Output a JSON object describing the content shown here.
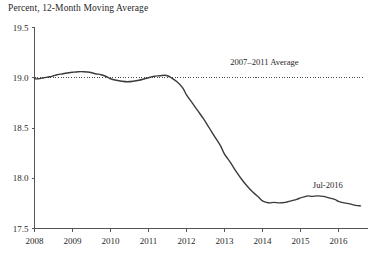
{
  "chart_data": {
    "type": "line",
    "title": "Percent, 12-Month Moving Average",
    "xlabel": "",
    "ylabel": "",
    "ylim": [
      17.5,
      19.5
    ],
    "xlim": [
      2008.0,
      2016.9
    ],
    "yticks": [
      "19.5",
      "19.0",
      "18.5",
      "18.0",
      "17.5"
    ],
    "ytick_values": [
      19.5,
      19.0,
      18.5,
      18.0,
      17.5
    ],
    "xticks": [
      "2008",
      "2009",
      "2010",
      "2011",
      "2012",
      "2013",
      "2014",
      "2015",
      "2016"
    ],
    "xtick_values": [
      2008,
      2009,
      2010,
      2011,
      2012,
      2013,
      2014,
      2015,
      2016
    ],
    "grid": false,
    "legend_position": "none",
    "series": [
      {
        "name": "Percent, 12-Month Moving Average",
        "x": [
          2008.0,
          2008.1,
          2008.25,
          2008.4,
          2008.5,
          2008.6,
          2008.75,
          2008.9,
          2009.0,
          2009.15,
          2009.3,
          2009.45,
          2009.6,
          2009.75,
          2009.9,
          2010.0,
          2010.15,
          2010.3,
          2010.45,
          2010.6,
          2010.75,
          2010.9,
          2011.0,
          2011.15,
          2011.3,
          2011.42,
          2011.5,
          2011.6,
          2011.75,
          2011.9,
          2012.0,
          2012.15,
          2012.3,
          2012.45,
          2012.6,
          2012.75,
          2012.9,
          2013.0,
          2013.15,
          2013.3,
          2013.45,
          2013.6,
          2013.75,
          2013.9,
          2014.0,
          2014.1,
          2014.2,
          2014.3,
          2014.45,
          2014.6,
          2014.75,
          2014.9,
          2015.0,
          2015.1,
          2015.2,
          2015.3,
          2015.45,
          2015.6,
          2015.75,
          2015.9,
          2016.0,
          2016.15,
          2016.3,
          2016.45,
          2016.58
        ],
        "y": [
          18.99,
          18.99,
          19.0,
          19.01,
          19.02,
          19.03,
          19.04,
          19.05,
          19.055,
          19.06,
          19.06,
          19.055,
          19.04,
          19.03,
          19.01,
          18.99,
          18.975,
          18.965,
          18.96,
          18.965,
          18.975,
          18.99,
          19.0,
          19.015,
          19.02,
          19.025,
          19.02,
          19.0,
          18.96,
          18.9,
          18.83,
          18.75,
          18.67,
          18.59,
          18.5,
          18.41,
          18.32,
          18.24,
          18.16,
          18.07,
          17.99,
          17.92,
          17.86,
          17.81,
          17.775,
          17.76,
          17.755,
          17.76,
          17.755,
          17.76,
          17.775,
          17.79,
          17.805,
          17.815,
          17.825,
          17.82,
          17.825,
          17.82,
          17.805,
          17.79,
          17.77,
          17.755,
          17.745,
          17.73,
          17.725
        ]
      }
    ],
    "annotations": [
      {
        "name": "average-reference-line",
        "text": "2007–2011 Average",
        "value": 19.0,
        "kind": "horizontal-dotted-line",
        "label_x": 2014.05,
        "label_y": 19.13
      },
      {
        "name": "last-observation",
        "text": "Jul-2016",
        "kind": "point-label",
        "label_x": 2015.72,
        "label_y": 17.905
      }
    ],
    "colors": {
      "series_line": "#3b3b3b",
      "reference_line": "#4a4a4a",
      "axis": "#555555",
      "text": "#1f1f1f",
      "background": "#ffffff"
    }
  }
}
